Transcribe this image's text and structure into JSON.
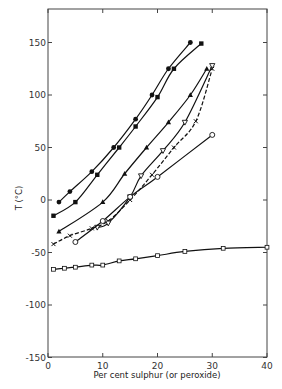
{
  "chart_data": {
    "type": "line",
    "title": "",
    "xlabel": "Per cent sulphur (or peroxide)",
    "ylabel": "T (°C)",
    "xlim": [
      0,
      40
    ],
    "ylim": [
      -150,
      180
    ],
    "xticks": [
      0,
      10,
      20,
      30,
      40
    ],
    "yticks": [
      150,
      100,
      50,
      0,
      -50,
      -100,
      -150
    ],
    "grid": false,
    "legend": null,
    "series": [
      {
        "name": "filled circles",
        "marker": "filled-circle",
        "x": [
          2,
          4,
          8,
          12,
          16,
          19,
          22,
          26
        ],
        "y": [
          -2,
          8,
          27,
          50,
          77,
          100,
          125,
          150
        ]
      },
      {
        "name": "filled squares",
        "marker": "filled-square",
        "x": [
          1,
          5,
          9,
          13,
          16,
          20,
          23,
          28
        ],
        "y": [
          -15,
          -2,
          24,
          50,
          70,
          98,
          125,
          149
        ]
      },
      {
        "name": "filled triangles",
        "marker": "filled-triangle",
        "x": [
          2,
          10,
          14,
          18,
          22,
          26,
          29
        ],
        "y": [
          -30,
          -2,
          25,
          50,
          74,
          100,
          125
        ]
      },
      {
        "name": "crosses",
        "marker": "cross",
        "dashed": true,
        "x": [
          1,
          4,
          8,
          11,
          15,
          19,
          23,
          27,
          30
        ],
        "y": [
          -42,
          -34,
          -27,
          -20,
          0,
          24,
          50,
          75,
          125
        ]
      },
      {
        "name": "open inverted triangles",
        "marker": "open-inverted-triangle",
        "x": [
          9,
          11,
          15,
          17,
          21,
          25,
          30
        ],
        "y": [
          -26,
          -22,
          3,
          23,
          47,
          74,
          128
        ]
      },
      {
        "name": "open circles",
        "marker": "open-circle",
        "x": [
          5,
          10,
          15,
          20,
          30
        ],
        "y": [
          -40,
          -20,
          3,
          22,
          62
        ]
      },
      {
        "name": "open squares",
        "marker": "open-square",
        "x": [
          1,
          3,
          5,
          8,
          10,
          13,
          16,
          20,
          25,
          32,
          40
        ],
        "y": [
          -66,
          -65,
          -64,
          -62,
          -62,
          -58,
          -56,
          -53,
          -49,
          -46,
          -45
        ]
      }
    ]
  },
  "axes": {
    "x_title": "Per cent sulphur (or peroxide)",
    "y_title": "T (°C)",
    "x_tick_labels": [
      "0",
      "10",
      "20",
      "30",
      "40"
    ],
    "y_tick_labels": [
      "150",
      "100",
      "50",
      "0",
      "-50",
      "-100",
      "-150"
    ]
  }
}
